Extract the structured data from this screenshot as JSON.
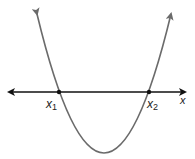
{
  "diagram": {
    "axis": {
      "label": "x"
    },
    "roots": [
      {
        "label": "x",
        "subscript": "1"
      },
      {
        "label": "x",
        "subscript": "2"
      }
    ],
    "colors": {
      "curve": "#6b6b6b",
      "axis": "#111111",
      "points": "#111111"
    }
  }
}
